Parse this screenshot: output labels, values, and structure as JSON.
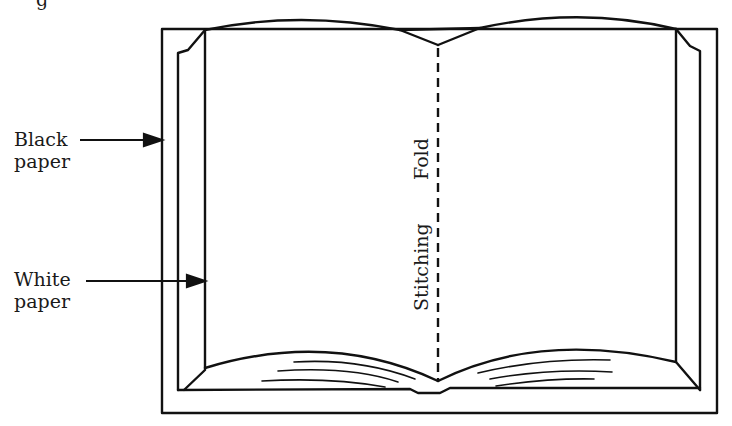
{
  "figure": {
    "partial_caption": "g",
    "labels": {
      "black_paper": [
        "Black",
        "paper"
      ],
      "white_paper": [
        "White",
        "paper"
      ],
      "fold": "Fold",
      "stitching": "Stitching"
    }
  },
  "colors": {
    "line": "#111111",
    "background": "#ffffff"
  }
}
